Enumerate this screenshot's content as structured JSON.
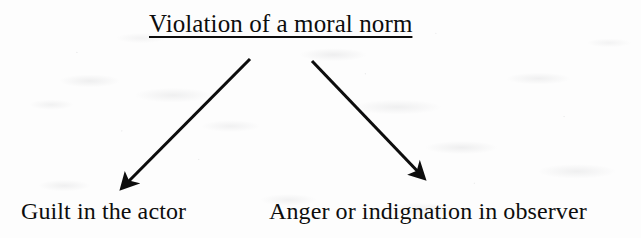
{
  "document": {
    "kind": "scanned-page-diagram",
    "media": "photocopied book page",
    "background_color": "#fdfdfd",
    "ink_color": "#0d0d0d"
  },
  "diagram": {
    "type": "flow-diagram",
    "orientation": "top-down branching",
    "title": {
      "text": "Violation of a moral norm",
      "underlined": true
    },
    "outcomes": [
      {
        "id": "left",
        "label": "Guilt in the actor",
        "underlined": false
      },
      {
        "id": "right",
        "label": "Anger or indignation in observer",
        "underlined": false
      }
    ],
    "arrows": [
      {
        "id": "arrow-to-guilt",
        "name": "arrow-down-left-icon",
        "from": "Violation of a moral norm",
        "to": "Guilt in the actor",
        "direction": "down-left",
        "head": "solid-triangle",
        "x1": 250,
        "y1": 59,
        "x2": 122,
        "y2": 188
      },
      {
        "id": "arrow-to-anger",
        "name": "arrow-down-right-icon",
        "from": "Violation of a moral norm",
        "to": "Anger or indignation in observer",
        "direction": "down-right",
        "head": "solid-triangle",
        "x1": 312,
        "y1": 61,
        "x2": 424,
        "y2": 178
      }
    ]
  }
}
